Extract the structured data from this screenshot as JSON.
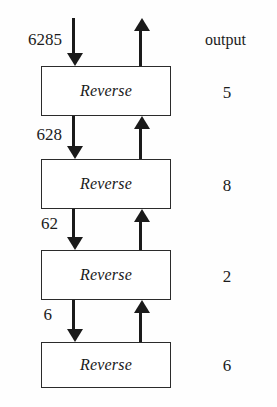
{
  "figure": {
    "type": "recursion-trace-diagram",
    "box_label": "Reverse",
    "output_header": "output",
    "levels": [
      {
        "input": "6285",
        "output": "5"
      },
      {
        "input": "628",
        "output": "8"
      },
      {
        "input": "62",
        "output": "2"
      },
      {
        "input": "6",
        "output": "6"
      }
    ],
    "arrows": {
      "down_icon": "arrow-down-icon",
      "up_icon": "arrow-up-icon"
    },
    "colors": {
      "ink": "#1c1c1c",
      "stroke": "#2b2b2b",
      "background": "#fefefe"
    }
  }
}
